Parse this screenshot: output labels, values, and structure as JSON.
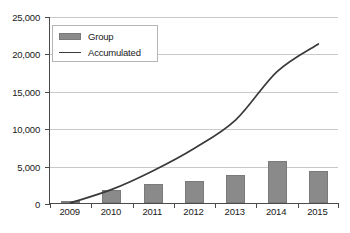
{
  "chart_data": {
    "type": "bar",
    "title": "",
    "xlabel": "",
    "ylabel": "",
    "categories": [
      "2009",
      "2010",
      "2011",
      "2012",
      "2013",
      "2014",
      "2015"
    ],
    "ylim": [
      0,
      25000
    ],
    "yticks": [
      0,
      5000,
      10000,
      15000,
      20000,
      25000
    ],
    "ytick_labels": [
      "0",
      "5,000",
      "10,000",
      "15,000",
      "20,000",
      "25,000"
    ],
    "grid": true,
    "legend_position": "top-left",
    "series": [
      {
        "name": "Group",
        "type": "bar",
        "color": "#8a8a8a",
        "values": [
          150,
          1800,
          2500,
          3000,
          3800,
          5600,
          4300
        ]
      },
      {
        "name": "Accumulated",
        "type": "line",
        "color": "#3a3a3a",
        "values": [
          150,
          1950,
          4450,
          7450,
          11250,
          17700,
          21400
        ]
      }
    ]
  },
  "legend": {
    "items": [
      {
        "label": "Group",
        "icon": "bar-swatch"
      },
      {
        "label": "Accumulated",
        "icon": "line-swatch"
      }
    ]
  }
}
